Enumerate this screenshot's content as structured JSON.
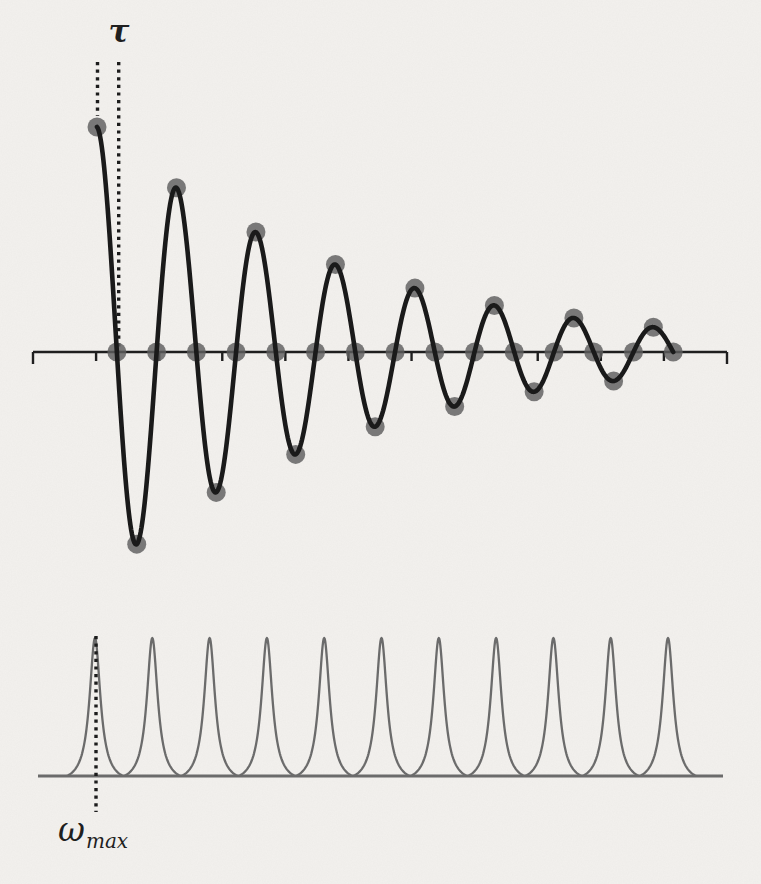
{
  "labels": {
    "tau": "τ",
    "omega_base": "ω",
    "omega_sub": "max"
  },
  "colors": {
    "background": "#f3f1ee",
    "curve": "#1a1a1a",
    "axis": "#1f1f1f",
    "dot": "#5e5e5e",
    "dotted_line": "#1c1c1c",
    "peak": "#6b6b6b",
    "baseline": "#6b6b6b",
    "label_text": "#1f1f1f"
  },
  "chart_data": [
    {
      "id": "time-domain-fid",
      "type": "line+scatter",
      "title": "",
      "xlabel": "",
      "ylabel": "",
      "annotation_label": "τ",
      "annotation_meaning": "sampling interval between first two samples, marked by two dotted vertical lines",
      "curve": {
        "model": "y(t) = exp(-t/decay) * cos(2*pi*t/period)",
        "decay": 12.7,
        "period": 4,
        "t_start": 0,
        "t_end": 29
      },
      "samples": {
        "t": [
          0,
          1,
          2,
          3,
          4,
          5,
          6,
          7,
          8,
          9,
          10,
          11,
          12,
          13,
          14,
          15,
          16,
          17,
          18,
          19,
          20,
          21,
          22,
          23,
          24,
          25,
          26,
          27,
          28,
          29
        ],
        "y": [
          1.0,
          0,
          -0.854,
          0,
          0.73,
          0,
          -0.624,
          0,
          0.533,
          0,
          -0.455,
          0,
          0.389,
          0,
          -0.332,
          0,
          0.284,
          0,
          -0.242,
          0,
          0.207,
          0,
          -0.177,
          0,
          0.151,
          0,
          -0.129,
          0,
          0.11,
          0
        ]
      },
      "axis": {
        "baseline_value": 0,
        "tick_count": 12,
        "grid": false,
        "ylim": [
          -1.05,
          1.05
        ]
      },
      "pixel_map": {
        "x0": 97,
        "px_per_sample": 19.87,
        "axis_y": 352,
        "amp_px": 225,
        "axis_x0": 33,
        "axis_x1": 727,
        "tick_len": 9,
        "end_tick_len": 12,
        "axis_width": 2.4,
        "curve_width": 4.6,
        "dot_radius": 9.5,
        "dot_opacity": 0.82,
        "tau_line_left_x": 97.5,
        "tau_line_right_x": 118.7,
        "tau_lines_top_y": 62,
        "tau_line_left_bottom_y": 116,
        "dotted_dash": "3.2 4.4",
        "dotted_width": 3.4
      }
    },
    {
      "id": "frequency-domain-spectrum",
      "type": "line",
      "title": "",
      "xlabel": "",
      "ylabel": "",
      "annotation_label": "ωmax",
      "annotation_meaning": "dotted vertical line through the first (leftmost) peak",
      "peaks": {
        "count": 11,
        "centers_index": [
          0,
          1,
          2,
          3,
          4,
          5,
          6,
          7,
          8,
          9,
          10
        ],
        "height": 1,
        "shape": "lorentzian",
        "hwhm_fraction_of_spacing": 0.115
      },
      "marker": {
        "at_peak_index": 0,
        "label": "ωmax"
      },
      "pixel_map": {
        "baseline_y": 776,
        "baseline_x0": 38,
        "baseline_x1": 723,
        "baseline_width": 3,
        "first_peak_x": 95,
        "spacing_px": 57.3,
        "height_px": 138,
        "hwhm_px": 6.6,
        "halfspan_px": 28,
        "peak_width": 2.3,
        "marker_x": 96,
        "marker_top_y": 636,
        "marker_bottom_y": 812
      }
    }
  ]
}
